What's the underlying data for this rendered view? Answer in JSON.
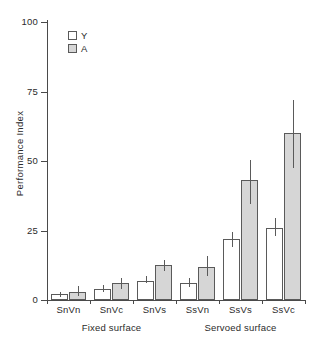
{
  "chart_data": {
    "type": "bar",
    "title": "",
    "xlabel": "",
    "ylabel": "Performance Index",
    "ylim": [
      0,
      100
    ],
    "yticks": [
      0,
      25,
      50,
      75,
      100
    ],
    "ytick_labels": [
      "0",
      "25",
      "50",
      "75",
      "100"
    ],
    "grid": false,
    "legend_position": "upper-left",
    "categories": [
      "SnVn",
      "SnVc",
      "SnVs",
      "SsVn",
      "SsVs",
      "SsVc"
    ],
    "groups": [
      {
        "label": "Fixed surface",
        "categories": [
          "SnVn",
          "SnVc",
          "SnVs"
        ]
      },
      {
        "label": "Servoed surface",
        "categories": [
          "SsVn",
          "SsVs",
          "SsVc"
        ]
      }
    ],
    "series": [
      {
        "name": "Y",
        "color": "#ffffff",
        "values": [
          2,
          4,
          7,
          6,
          22,
          26
        ],
        "err_low": [
          1,
          3,
          6,
          4.5,
          19,
          23
        ],
        "err_high": [
          3,
          5.5,
          8.5,
          8,
          24.5,
          29.5
        ]
      },
      {
        "name": "A",
        "color": "#d6d6d6",
        "values": [
          3,
          6,
          12.5,
          12,
          43,
          60
        ],
        "err_low": [
          1.5,
          4,
          10.5,
          8.5,
          34.5,
          47.5
        ],
        "err_high": [
          5,
          8,
          14.5,
          16,
          50.5,
          72
        ]
      }
    ]
  },
  "legend": {
    "items": [
      {
        "label": "Y",
        "swatch": "white-square"
      },
      {
        "label": "A",
        "swatch": "gray-square"
      }
    ]
  },
  "axes": {
    "y_title": "Performance Index",
    "y_tick_labels": [
      "100",
      "75",
      "50",
      "25",
      "0"
    ]
  }
}
